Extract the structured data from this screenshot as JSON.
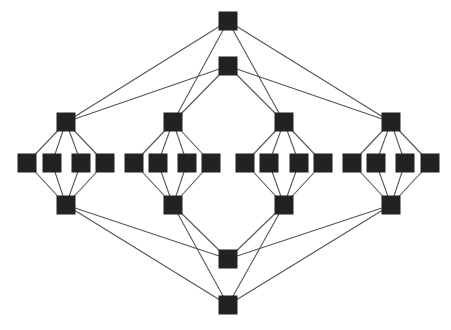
{
  "diagram": {
    "type": "graph",
    "node_size": 19,
    "colors": {
      "node": "#222222",
      "edge": "#555555",
      "background": "#ffffff"
    },
    "nodes": [
      {
        "id": "A1",
        "x": 228,
        "y": 21
      },
      {
        "id": "A2",
        "x": 228,
        "y": 66
      },
      {
        "id": "G1T",
        "x": 66,
        "y": 122
      },
      {
        "id": "G2T",
        "x": 173,
        "y": 122
      },
      {
        "id": "G3T",
        "x": 284,
        "y": 122
      },
      {
        "id": "G4T",
        "x": 391,
        "y": 122
      },
      {
        "id": "G1C1",
        "x": 27,
        "y": 163
      },
      {
        "id": "G1C2",
        "x": 52,
        "y": 163
      },
      {
        "id": "G1C3",
        "x": 81,
        "y": 163
      },
      {
        "id": "G1C4",
        "x": 105,
        "y": 163
      },
      {
        "id": "G2C1",
        "x": 134,
        "y": 163
      },
      {
        "id": "G2C2",
        "x": 158,
        "y": 163
      },
      {
        "id": "G2C3",
        "x": 187,
        "y": 163
      },
      {
        "id": "G2C4",
        "x": 211,
        "y": 163
      },
      {
        "id": "G3C1",
        "x": 245,
        "y": 163
      },
      {
        "id": "G3C2",
        "x": 269,
        "y": 163
      },
      {
        "id": "G3C3",
        "x": 299,
        "y": 163
      },
      {
        "id": "G3C4",
        "x": 323,
        "y": 163
      },
      {
        "id": "G4C1",
        "x": 352,
        "y": 163
      },
      {
        "id": "G4C2",
        "x": 376,
        "y": 163
      },
      {
        "id": "G4C3",
        "x": 405,
        "y": 163
      },
      {
        "id": "G4C4",
        "x": 430,
        "y": 163
      },
      {
        "id": "G1B",
        "x": 66,
        "y": 205
      },
      {
        "id": "G2B",
        "x": 173,
        "y": 205
      },
      {
        "id": "G3B",
        "x": 284,
        "y": 205
      },
      {
        "id": "G4B",
        "x": 391,
        "y": 205
      },
      {
        "id": "B1",
        "x": 228,
        "y": 259
      },
      {
        "id": "B2",
        "x": 228,
        "y": 305
      }
    ],
    "edges": [
      [
        "A1",
        "G1T"
      ],
      [
        "A1",
        "G2T"
      ],
      [
        "A1",
        "G3T"
      ],
      [
        "A1",
        "G4T"
      ],
      [
        "A2",
        "G1T"
      ],
      [
        "A2",
        "G2T"
      ],
      [
        "A2",
        "G3T"
      ],
      [
        "A2",
        "G4T"
      ],
      [
        "G1T",
        "G1C1"
      ],
      [
        "G1T",
        "G1C2"
      ],
      [
        "G1T",
        "G1C3"
      ],
      [
        "G1T",
        "G1C4"
      ],
      [
        "G2T",
        "G2C1"
      ],
      [
        "G2T",
        "G2C2"
      ],
      [
        "G2T",
        "G2C3"
      ],
      [
        "G2T",
        "G2C4"
      ],
      [
        "G3T",
        "G3C1"
      ],
      [
        "G3T",
        "G3C2"
      ],
      [
        "G3T",
        "G3C3"
      ],
      [
        "G3T",
        "G3C4"
      ],
      [
        "G4T",
        "G4C1"
      ],
      [
        "G4T",
        "G4C2"
      ],
      [
        "G4T",
        "G4C3"
      ],
      [
        "G4T",
        "G4C4"
      ],
      [
        "G1B",
        "G1C1"
      ],
      [
        "G1B",
        "G1C2"
      ],
      [
        "G1B",
        "G1C3"
      ],
      [
        "G1B",
        "G1C4"
      ],
      [
        "G2B",
        "G2C1"
      ],
      [
        "G2B",
        "G2C2"
      ],
      [
        "G2B",
        "G2C3"
      ],
      [
        "G2B",
        "G2C4"
      ],
      [
        "G3B",
        "G3C1"
      ],
      [
        "G3B",
        "G3C2"
      ],
      [
        "G3B",
        "G3C3"
      ],
      [
        "G3B",
        "G3C4"
      ],
      [
        "G4B",
        "G4C1"
      ],
      [
        "G4B",
        "G4C2"
      ],
      [
        "G4B",
        "G4C3"
      ],
      [
        "G4B",
        "G4C4"
      ],
      [
        "B1",
        "G1B"
      ],
      [
        "B1",
        "G2B"
      ],
      [
        "B1",
        "G3B"
      ],
      [
        "B1",
        "G4B"
      ],
      [
        "B2",
        "G1B"
      ],
      [
        "B2",
        "G2B"
      ],
      [
        "B2",
        "G3B"
      ],
      [
        "B2",
        "G4B"
      ]
    ]
  }
}
